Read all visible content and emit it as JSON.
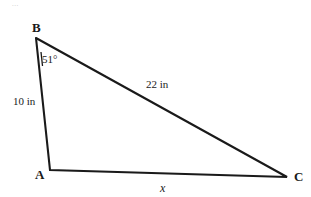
{
  "figure": {
    "type": "triangle-diagram",
    "background_color": "#ffffff",
    "stroke_color": "#1a1a1a",
    "vertices": {
      "A": {
        "label": "A",
        "x": 50,
        "y": 170
      },
      "B": {
        "label": "B",
        "x": 36,
        "y": 38
      },
      "C": {
        "label": "C",
        "x": 287,
        "y": 177
      }
    },
    "sides": [
      {
        "name": "AB",
        "label": "10 in",
        "value": 10,
        "unit": "in",
        "from": "A",
        "to": "B"
      },
      {
        "name": "BC",
        "label": "22 in",
        "value": 22,
        "unit": "in",
        "from": "B",
        "to": "C"
      },
      {
        "name": "AC",
        "label": "x",
        "value": null,
        "unit": "in",
        "from": "A",
        "to": "C"
      }
    ],
    "angles": [
      {
        "at": "B",
        "label": "51°",
        "value": 51,
        "unit": "degrees"
      }
    ],
    "artifact_text": "..."
  }
}
